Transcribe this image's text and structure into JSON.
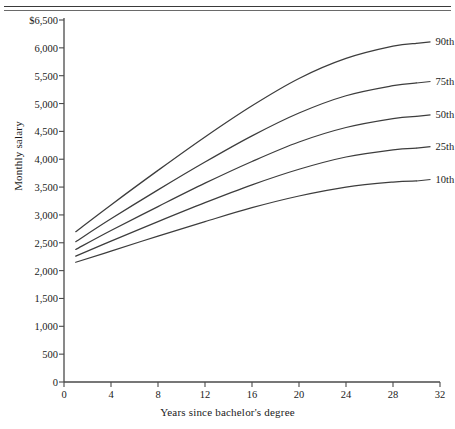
{
  "chart_data": {
    "type": "line",
    "title": "",
    "xlabel": "Years since bachelor's degree",
    "ylabel": "Monthly salary",
    "xlim": [
      0,
      32
    ],
    "ylim": [
      0,
      6500
    ],
    "grid": false,
    "legend_position": "right-inline-labels",
    "xticks": [
      "0",
      "4",
      "8",
      "12",
      "16",
      "20",
      "24",
      "28",
      "32"
    ],
    "xtick_values": [
      0,
      4,
      8,
      12,
      16,
      20,
      24,
      28,
      32
    ],
    "yticks": [
      "0",
      "500",
      "1,000",
      "1,500",
      "2,000",
      "2,500",
      "3,000",
      "3,500",
      "4,000",
      "4,500",
      "5,000",
      "5,500",
      "6,000",
      "$6,500"
    ],
    "ytick_values": [
      0,
      500,
      1000,
      1500,
      2000,
      2500,
      3000,
      3500,
      4000,
      4500,
      5000,
      5500,
      6000,
      6500
    ],
    "x": [
      1,
      4,
      8,
      12,
      16,
      20,
      24,
      28,
      30
    ],
    "series": [
      {
        "name": "90th",
        "label": "90th",
        "color": "#3d3d3d",
        "values": [
          2700,
          3180,
          3800,
          4400,
          4960,
          5450,
          5810,
          6030,
          6080
        ]
      },
      {
        "name": "75th",
        "label": "75th",
        "color": "#3d3d3d",
        "values": [
          2520,
          2930,
          3450,
          3950,
          4420,
          4830,
          5140,
          5320,
          5370
        ]
      },
      {
        "name": "50th",
        "label": "50th",
        "color": "#3d3d3d",
        "values": [
          2380,
          2720,
          3150,
          3570,
          3960,
          4310,
          4570,
          4730,
          4770
        ]
      },
      {
        "name": "25th",
        "label": "25th",
        "color": "#3d3d3d",
        "values": [
          2260,
          2530,
          2880,
          3220,
          3540,
          3820,
          4040,
          4170,
          4200
        ]
      },
      {
        "name": "10th",
        "label": "10th",
        "color": "#3d3d3d",
        "values": [
          2150,
          2350,
          2620,
          2880,
          3130,
          3340,
          3500,
          3590,
          3610
        ]
      }
    ]
  },
  "axis": {
    "x_label": "Years since bachelor's degree",
    "y_label": "Monthly salary"
  }
}
